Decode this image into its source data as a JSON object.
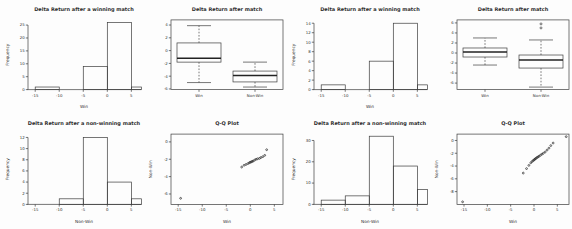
{
  "page": {
    "background": "#fdfdfd",
    "line_color": "#3c3c3c",
    "text_color": "#2e2e2e",
    "rows": 2,
    "cols": 4
  },
  "chart_data": [
    {
      "id": "hist-winning-a",
      "type": "bar",
      "subtype": "histogram",
      "title": "Delta Return after a winning match",
      "xlabel": "Win",
      "ylabel": "Frequency",
      "xticks": [
        -15,
        -10,
        -5,
        0,
        5
      ],
      "yticks": [
        0,
        5,
        10,
        15,
        20,
        25
      ],
      "xlim": [
        -16.5,
        6.8
      ],
      "ylim": [
        0,
        27
      ],
      "bins": [
        [
          -15,
          -10,
          1
        ],
        [
          -5,
          0,
          9
        ],
        [
          0,
          5,
          26
        ],
        [
          5,
          10,
          1
        ]
      ],
      "grid": false
    },
    {
      "id": "boxplot-after-match-a",
      "type": "boxplot",
      "title": "Delta Return after match",
      "xlabel": "",
      "ylabel": "",
      "categories": [
        "Win",
        "Non-Win"
      ],
      "yticks": [
        4,
        2,
        0,
        -2,
        -4,
        -6
      ],
      "xlim": [
        0.5,
        2.5
      ],
      "ylim": [
        -6.1,
        4.8
      ],
      "boxes": [
        {
          "label": "Win",
          "whisker_low": -5.0,
          "q1": -1.8,
          "median": -1.2,
          "q3": 1.2,
          "whisker_high": 3.9,
          "outliers": []
        },
        {
          "label": "Non-Win",
          "whisker_low": -5.7,
          "q1": -4.9,
          "median": -3.9,
          "q3": -3.2,
          "whisker_high": -1.8,
          "outliers": []
        }
      ],
      "grid": false
    },
    {
      "id": "hist-winning-b",
      "type": "bar",
      "subtype": "histogram",
      "title": "Delta Return after a winning match",
      "xlabel": "Win",
      "ylabel": "Frequency",
      "xticks": [
        -15,
        -10,
        -5,
        0,
        5
      ],
      "yticks": [
        0,
        2,
        4,
        6,
        8,
        10,
        12,
        14
      ],
      "xlim": [
        -16.5,
        6.8
      ],
      "ylim": [
        0,
        14.7
      ],
      "bins": [
        [
          -15,
          -10,
          1
        ],
        [
          -5,
          0,
          6
        ],
        [
          0,
          5,
          14
        ],
        [
          5,
          10,
          1
        ]
      ],
      "grid": false
    },
    {
      "id": "boxplot-after-match-b",
      "type": "boxplot",
      "title": "Delta Return after match",
      "xlabel": "",
      "ylabel": "",
      "categories": [
        "Win",
        "Non-Win"
      ],
      "yticks": [
        6,
        4,
        2,
        0,
        -2,
        -4,
        -6
      ],
      "xlim": [
        0.5,
        2.5
      ],
      "ylim": [
        -7.3,
        6.6
      ],
      "boxes": [
        {
          "label": "Win",
          "whisker_low": -2.4,
          "q1": -0.8,
          "median": 0.2,
          "q3": 1.0,
          "whisker_high": 3.0,
          "outliers": []
        },
        {
          "label": "Non-Win",
          "whisker_low": -6.8,
          "q1": -3.0,
          "median": -1.4,
          "q3": -0.4,
          "whisker_high": 2.6,
          "outliers": [
            5.8,
            5.0
          ]
        }
      ],
      "grid": false
    },
    {
      "id": "hist-nonwinning-a",
      "type": "bar",
      "subtype": "histogram",
      "title": "Delta Return after a non-winning match",
      "xlabel": "Non-Win",
      "ylabel": "Frequency",
      "xticks": [
        -15,
        -10,
        -5,
        0,
        5
      ],
      "yticks": [
        0,
        2,
        4,
        6,
        8,
        10,
        12
      ],
      "xlim": [
        -16.5,
        6.8
      ],
      "ylim": [
        0,
        12.6
      ],
      "bins": [
        [
          -10,
          -5,
          1
        ],
        [
          -5,
          0,
          12
        ],
        [
          0,
          5,
          4
        ],
        [
          5,
          10,
          1
        ]
      ],
      "grid": false
    },
    {
      "id": "qq-plot-a",
      "type": "scatter",
      "subtype": "qq",
      "title": "Q-Q Plot",
      "xlabel": "Win",
      "ylabel": "Non-Win",
      "xticks": [
        -15,
        -10,
        -5,
        0,
        5
      ],
      "yticks": [
        0,
        -2,
        -4,
        -6
      ],
      "xlim": [
        -16.5,
        6.8
      ],
      "ylim": [
        -7.2,
        0.9
      ],
      "points": [
        [
          -14.5,
          -6.5
        ],
        [
          -1.8,
          -2.9
        ],
        [
          -1.3,
          -2.7
        ],
        [
          -0.9,
          -2.6
        ],
        [
          -0.5,
          -2.5
        ],
        [
          -0.2,
          -2.4
        ],
        [
          0.0,
          -2.35
        ],
        [
          0.2,
          -2.3
        ],
        [
          0.4,
          -2.25
        ],
        [
          0.6,
          -2.2
        ],
        [
          0.9,
          -2.1
        ],
        [
          1.2,
          -2.0
        ],
        [
          1.5,
          -1.95
        ],
        [
          1.9,
          -1.9
        ],
        [
          2.2,
          -1.8
        ],
        [
          2.6,
          -1.7
        ],
        [
          3.0,
          -1.55
        ],
        [
          3.4,
          -0.9
        ]
      ],
      "grid": false
    },
    {
      "id": "hist-nonwinning-b",
      "type": "bar",
      "subtype": "histogram",
      "title": "Delta Return after a non-winning match",
      "xlabel": "Non-Win",
      "ylabel": "Frequency",
      "xticks": [
        -15,
        -10,
        -5,
        0,
        5
      ],
      "yticks": [
        0,
        10,
        20,
        30
      ],
      "xlim": [
        -16.5,
        6.8
      ],
      "ylim": [
        0,
        33
      ],
      "bins": [
        [
          -15,
          -10,
          2
        ],
        [
          -10,
          -5,
          4
        ],
        [
          -5,
          0,
          32
        ],
        [
          0,
          5,
          18
        ],
        [
          5,
          10,
          7
        ]
      ],
      "grid": false
    },
    {
      "id": "qq-plot-b",
      "type": "scatter",
      "subtype": "qq",
      "title": "Q-Q Plot",
      "xlabel": "Win",
      "ylabel": "Non-Win",
      "xticks": [
        -15,
        -10,
        -5,
        0,
        5
      ],
      "yticks": [
        0,
        -2,
        -4,
        -6,
        -8
      ],
      "xlim": [
        -16.5,
        7.5
      ],
      "ylim": [
        -10,
        1
      ],
      "points": [
        [
          -15.3,
          -9.6
        ],
        [
          -2.3,
          -5.1
        ],
        [
          -1.6,
          -4.4
        ],
        [
          -1.1,
          -3.9
        ],
        [
          -0.7,
          -3.5
        ],
        [
          -0.4,
          -3.3
        ],
        [
          -0.2,
          -3.15
        ],
        [
          0.0,
          -3.05
        ],
        [
          0.15,
          -2.95
        ],
        [
          0.3,
          -2.85
        ],
        [
          0.5,
          -2.75
        ],
        [
          0.7,
          -2.65
        ],
        [
          0.9,
          -2.55
        ],
        [
          1.1,
          -2.45
        ],
        [
          1.4,
          -2.3
        ],
        [
          1.7,
          -2.15
        ],
        [
          2.0,
          -2.0
        ],
        [
          2.4,
          -1.8
        ],
        [
          2.8,
          -1.5
        ],
        [
          3.2,
          -1.2
        ],
        [
          3.6,
          -0.8
        ],
        [
          4.1,
          -0.4
        ],
        [
          6.9,
          0.6
        ]
      ],
      "grid": false
    }
  ]
}
